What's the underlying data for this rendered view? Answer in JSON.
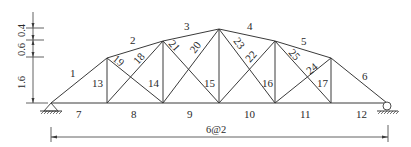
{
  "diagram": {
    "type": "truss",
    "span": {
      "panels": 6,
      "panel_length_m": 2,
      "label": "6@2"
    },
    "height_dimensions": [
      {
        "label": "1.6",
        "value_m": 1.6
      },
      {
        "label": "0.6",
        "value_m": 0.6
      },
      {
        "label": "0.4",
        "value_m": 0.4
      }
    ],
    "nodes": {
      "bottom": [
        {
          "id": "B0",
          "x_m": 0,
          "y_m": 0
        },
        {
          "id": "B1",
          "x_m": 2,
          "y_m": 0
        },
        {
          "id": "B2",
          "x_m": 4,
          "y_m": 0
        },
        {
          "id": "B3",
          "x_m": 6,
          "y_m": 0
        },
        {
          "id": "B4",
          "x_m": 8,
          "y_m": 0
        },
        {
          "id": "B5",
          "x_m": 10,
          "y_m": 0
        },
        {
          "id": "B6",
          "x_m": 12,
          "y_m": 0
        }
      ],
      "top": [
        {
          "id": "T1",
          "x_m": 2,
          "y_m": 1.6
        },
        {
          "id": "T2",
          "x_m": 4,
          "y_m": 2.2
        },
        {
          "id": "T3",
          "x_m": 6,
          "y_m": 2.6
        },
        {
          "id": "T4",
          "x_m": 8,
          "y_m": 2.2
        },
        {
          "id": "T5",
          "x_m": 10,
          "y_m": 1.6
        }
      ]
    },
    "members": {
      "top_chord": [
        {
          "label": "1",
          "from": "B0",
          "to": "T1"
        },
        {
          "label": "2",
          "from": "T1",
          "to": "T2"
        },
        {
          "label": "3",
          "from": "T2",
          "to": "T3"
        },
        {
          "label": "4",
          "from": "T3",
          "to": "T4"
        },
        {
          "label": "5",
          "from": "T4",
          "to": "T5"
        },
        {
          "label": "6",
          "from": "T5",
          "to": "B6"
        }
      ],
      "bottom_chord": [
        {
          "label": "7",
          "from": "B0",
          "to": "B1"
        },
        {
          "label": "8",
          "from": "B1",
          "to": "B2"
        },
        {
          "label": "9",
          "from": "B2",
          "to": "B3"
        },
        {
          "label": "10",
          "from": "B3",
          "to": "B4"
        },
        {
          "label": "11",
          "from": "B4",
          "to": "B5"
        },
        {
          "label": "12",
          "from": "B5",
          "to": "B6"
        }
      ],
      "verticals": [
        {
          "label": "13",
          "from": "B1",
          "to": "T1"
        },
        {
          "label": "14",
          "from": "B2",
          "to": "T2"
        },
        {
          "label": "15",
          "from": "B3",
          "to": "T3"
        },
        {
          "label": "16",
          "from": "B4",
          "to": "T4"
        },
        {
          "label": "17",
          "from": "B5",
          "to": "T5"
        }
      ],
      "diagonals": [
        {
          "label": "18",
          "from": "B1",
          "to": "T2"
        },
        {
          "label": "19",
          "from": "T1",
          "to": "B2"
        },
        {
          "label": "20",
          "from": "B2",
          "to": "T3"
        },
        {
          "label": "21",
          "from": "T2",
          "to": "B3"
        },
        {
          "label": "22",
          "from": "B3",
          "to": "T4"
        },
        {
          "label": "23",
          "from": "T3",
          "to": "B4"
        },
        {
          "label": "24",
          "from": "B4",
          "to": "T5"
        },
        {
          "label": "25",
          "from": "T4",
          "to": "B5"
        }
      ]
    },
    "supports": [
      {
        "node": "B0",
        "type": "pin"
      },
      {
        "node": "B6",
        "type": "roller"
      }
    ],
    "labels": {
      "m1": "1",
      "m2": "2",
      "m3": "3",
      "m4": "4",
      "m5": "5",
      "m6": "6",
      "m7": "7",
      "m8": "8",
      "m9": "9",
      "m10": "10",
      "m11": "11",
      "m12": "12",
      "m13": "13",
      "m14": "14",
      "m15": "15",
      "m16": "16",
      "m17": "17",
      "m18": "18",
      "m19": "19",
      "m20": "20",
      "m21": "21",
      "m22": "22",
      "m23": "23",
      "m24": "24",
      "m25": "25",
      "dim_span": "6@2",
      "dim_h1": "1.6",
      "dim_h2": "0.6",
      "dim_h3": "0.4"
    }
  }
}
